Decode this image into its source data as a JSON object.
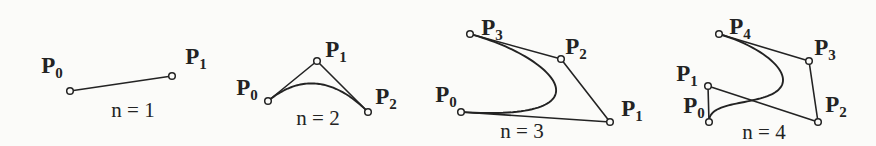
{
  "diagram": {
    "background_color": "#fbfbf9",
    "ink_color": "#232323",
    "style": {
      "point_radius": 3.3,
      "curve_width": 1.9,
      "polygon_width": 1.6
    },
    "panels": [
      {
        "id": "n1",
        "degree": 1,
        "caption": {
          "text": "n = 1",
          "x": 133,
          "y": 117
        },
        "points": [
          {
            "label": "P",
            "subscript": "0",
            "x": 70,
            "y": 91,
            "label_x": 52,
            "label_y": 73
          },
          {
            "label": "P",
            "subscript": "1",
            "x": 172,
            "y": 76,
            "label_x": 196,
            "label_y": 64
          }
        ]
      },
      {
        "id": "n2",
        "degree": 2,
        "caption": {
          "text": "n = 2",
          "x": 318,
          "y": 125
        },
        "points": [
          {
            "label": "P",
            "subscript": "0",
            "x": 268,
            "y": 101,
            "label_x": 247,
            "label_y": 95
          },
          {
            "label": "P",
            "subscript": "1",
            "x": 317,
            "y": 61,
            "label_x": 336,
            "label_y": 57
          },
          {
            "label": "P",
            "subscript": "2",
            "x": 368,
            "y": 112,
            "label_x": 386,
            "label_y": 104
          }
        ]
      },
      {
        "id": "n3",
        "degree": 3,
        "caption": {
          "text": "n = 3",
          "x": 522,
          "y": 138
        },
        "points": [
          {
            "label": "P",
            "subscript": "0",
            "x": 461,
            "y": 112,
            "label_x": 446,
            "label_y": 102
          },
          {
            "label": "P",
            "subscript": "1",
            "x": 610,
            "y": 122,
            "label_x": 632,
            "label_y": 116
          },
          {
            "label": "P",
            "subscript": "2",
            "x": 561,
            "y": 59,
            "label_x": 576,
            "label_y": 54
          },
          {
            "label": "P",
            "subscript": "3",
            "x": 470,
            "y": 34,
            "label_x": 492,
            "label_y": 35
          }
        ]
      },
      {
        "id": "n4",
        "degree": 4,
        "caption": {
          "text": "n = 4",
          "x": 764,
          "y": 139
        },
        "points": [
          {
            "label": "P",
            "subscript": "0",
            "x": 709,
            "y": 122,
            "label_x": 694,
            "label_y": 113
          },
          {
            "label": "P",
            "subscript": "1",
            "x": 708,
            "y": 86,
            "label_x": 687,
            "label_y": 81
          },
          {
            "label": "P",
            "subscript": "2",
            "x": 818,
            "y": 122,
            "label_x": 836,
            "label_y": 112
          },
          {
            "label": "P",
            "subscript": "3",
            "x": 809,
            "y": 61,
            "label_x": 825,
            "label_y": 55
          },
          {
            "label": "P",
            "subscript": "4",
            "x": 719,
            "y": 34,
            "label_x": 740,
            "label_y": 34
          }
        ]
      }
    ]
  }
}
